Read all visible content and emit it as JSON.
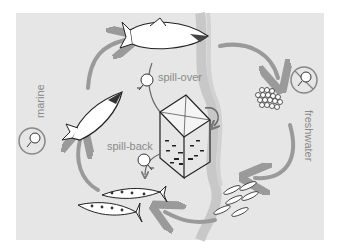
{
  "diagram": {
    "type": "life-cycle",
    "labels": {
      "marine": "marine",
      "freshwater": "freshwater",
      "spill_over": "spill-over",
      "spill_back": "spill-back"
    },
    "stages": [
      {
        "id": "adult-returning",
        "icon": "adult-salmon-icon"
      },
      {
        "id": "eggs",
        "icon": "eggs-icon"
      },
      {
        "id": "alevins",
        "icon": "alevins-icon"
      },
      {
        "id": "smolts",
        "icon": "smolt-fish-icon"
      },
      {
        "id": "ocean-salmon",
        "icon": "ocean-salmon-icon"
      }
    ],
    "elements": {
      "net_pen": "fish-farm-net-pen-icon",
      "pathogen": "pathogen-icon",
      "no_pathogen_marine": "pathogen-in-circle",
      "no_pathogen_freshwater": "pathogen-prohibited"
    },
    "colors": {
      "background": "#e6e6e6",
      "arrow": "#9a9a9a",
      "text": "#8a8a8a",
      "shoreline": "#c8c8c8"
    }
  }
}
